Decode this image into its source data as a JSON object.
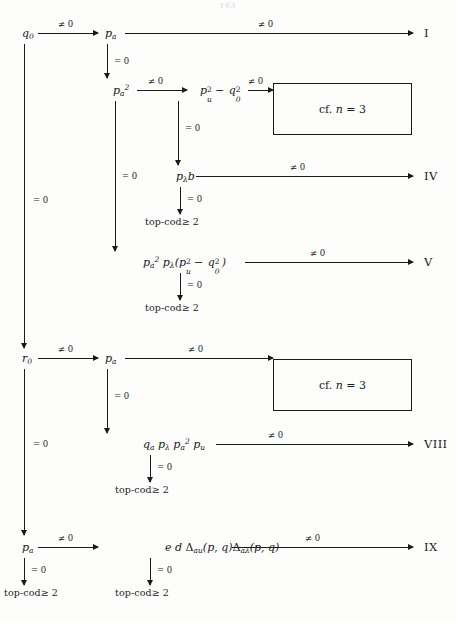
{
  "page": {
    "folio": "163",
    "width": 456,
    "height": 623,
    "ink_color": "#1a1a1a",
    "paper_color": "#fdfdfc"
  },
  "labels": {
    "nonzero": "≠ 0",
    "zero": "= 0",
    "topcod": "top-cod≥ 2",
    "cf_box": "cf. n = 3"
  },
  "nodes": {
    "q0": {
      "text": "q0",
      "x": 22,
      "y": 33
    },
    "pa_top": {
      "text": "pa",
      "x": 105,
      "y": 33
    },
    "pa2": {
      "text": "pa²",
      "x": 113,
      "y": 90
    },
    "pu2_q02": {
      "text": "pu² − q0²",
      "x": 200,
      "y": 90
    },
    "plb": {
      "text": "pλb",
      "x": 176,
      "y": 176
    },
    "pa2plexpr": {
      "text": "pa² pλ(pu² − q0²)",
      "x": 143,
      "y": 262
    },
    "r0": {
      "text": "r0",
      "x": 22,
      "y": 358
    },
    "pa_mid": {
      "text": "pa",
      "x": 105,
      "y": 358
    },
    "qaplpa2pu": {
      "text": "qa pλ pa² pu",
      "x": 143,
      "y": 444
    },
    "pa_bot": {
      "text": "pa",
      "x": 22,
      "y": 547
    },
    "eddelta": {
      "text": "e d Δau(p, q)Δaλ(p, q)",
      "x": 165,
      "y": 547
    }
  },
  "terminals": [
    {
      "name": "I",
      "label": "I",
      "x": 424,
      "y": 33
    },
    {
      "name": "IV",
      "label": "IV",
      "x": 424,
      "y": 176
    },
    {
      "name": "V",
      "label": "V",
      "x": 424,
      "y": 262
    },
    {
      "name": "VIII",
      "label": "VIII",
      "x": 424,
      "y": 444
    },
    {
      "name": "IX",
      "label": "IX",
      "x": 424,
      "y": 547
    }
  ],
  "boxes": [
    {
      "name": "cf-box-top",
      "text": "cf. n = 3",
      "x": 273,
      "y": 83,
      "w": 137,
      "h": 50
    },
    {
      "name": "cf-box-bottom",
      "text": "cf. n = 3",
      "x": 273,
      "y": 359,
      "w": 137,
      "h": 50
    }
  ],
  "edges": {
    "h": [
      {
        "name": "q0-to-pa",
        "label": "≠ 0",
        "x": 38,
        "y": 33,
        "w": 60
      },
      {
        "name": "pa-to-I",
        "label": "≠ 0",
        "x": 125,
        "y": 33,
        "w": 288
      },
      {
        "name": "pa2-to-pu2q02",
        "label": "≠ 0",
        "x": 137,
        "y": 90,
        "w": 50
      },
      {
        "name": "pu2q02-to-box",
        "label": "≠ 0",
        "x": 248,
        "y": 90,
        "w": 25
      },
      {
        "name": "plb-to-IV",
        "label": "≠ 0",
        "x": 196,
        "y": 176,
        "w": 217
      },
      {
        "name": "expr-to-V",
        "label": "≠ 0",
        "x": 245,
        "y": 262,
        "w": 168
      },
      {
        "name": "r0-to-pa",
        "label": "≠ 0",
        "x": 38,
        "y": 358,
        "w": 60
      },
      {
        "name": "pa-to-box",
        "label": "≠ 0",
        "x": 125,
        "y": 358,
        "w": 148
      },
      {
        "name": "qexpr-to-VIII",
        "label": "≠ 0",
        "x": 216,
        "y": 444,
        "w": 197
      },
      {
        "name": "pa-to-eddelta",
        "label": "≠ 0",
        "x": 38,
        "y": 547,
        "w": 60
      },
      {
        "name": "eddelta-to-IX",
        "label": "≠ 0",
        "x": 232,
        "y": 547,
        "w": 181
      }
    ],
    "v": [
      {
        "name": "q0-down-to-r0",
        "label": "= 0",
        "x": 24,
        "y": 44,
        "h": 304,
        "label_y": 200,
        "arrow": true
      },
      {
        "name": "pa-down-to-pa2",
        "label": "= 0",
        "x": 107,
        "y": 44,
        "h": 34,
        "label_y": 61,
        "arrow": true
      },
      {
        "name": "pa2-down-to-expr",
        "label": "= 0",
        "x": 115,
        "y": 101,
        "h": 150,
        "label_y": 176,
        "arrow": true
      },
      {
        "name": "pu2q02-down-to-plb",
        "label": "= 0",
        "x": 178,
        "y": 101,
        "h": 64,
        "label_y": 128,
        "arrow": true
      },
      {
        "name": "plb-down-to-topcod",
        "label": "= 0",
        "x": 180,
        "y": 187,
        "h": 27,
        "label_y": 199,
        "arrow": true
      },
      {
        "name": "expr-down-to-topcod",
        "label": "= 0",
        "x": 180,
        "y": 273,
        "h": 27,
        "label_y": 285,
        "arrow": true
      },
      {
        "name": "r0-down-to-pa",
        "label": "= 0",
        "x": 24,
        "y": 369,
        "h": 166,
        "label_y": 444,
        "arrow": true
      },
      {
        "name": "pa-down-to-qexpr",
        "label": "= 0",
        "x": 107,
        "y": 369,
        "h": 64,
        "label_y": 396,
        "arrow": true
      },
      {
        "name": "qexpr-down-to-topcod",
        "label": "= 0",
        "x": 150,
        "y": 455,
        "h": 27,
        "label_y": 467,
        "arrow": true
      },
      {
        "name": "pa-down-to-topcod-l",
        "label": "= 0",
        "x": 24,
        "y": 558,
        "h": 27,
        "label_y": 570,
        "arrow": true
      },
      {
        "name": "eddelta-down-to-topcod",
        "label": "= 0",
        "x": 150,
        "y": 558,
        "h": 27,
        "label_y": 570,
        "arrow": true
      }
    ]
  },
  "topcods": [
    {
      "name": "topcod-plb",
      "text": "top-cod≥ 2",
      "x": 145,
      "y": 221
    },
    {
      "name": "topcod-expr",
      "text": "top-cod≥ 2",
      "x": 145,
      "y": 307
    },
    {
      "name": "topcod-qexpr",
      "text": "top-cod≥ 2",
      "x": 115,
      "y": 489
    },
    {
      "name": "topcod-pa-bot",
      "text": "top-cod≥ 2",
      "x": 4,
      "y": 592
    },
    {
      "name": "topcod-ed-bot",
      "text": "top-cod≥ 2",
      "x": 115,
      "y": 592
    }
  ]
}
